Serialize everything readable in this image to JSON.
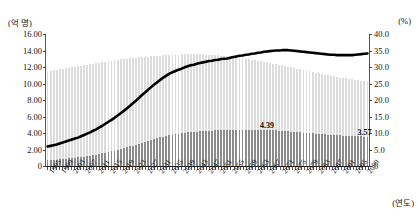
{
  "chart_data": {
    "type": "bar",
    "title": "",
    "subtitle": "",
    "xlabel": "(연도)",
    "ylabel": "(억 명)",
    "y2label": "(%)",
    "grid": false,
    "legend_position": "none",
    "ylim": [
      0,
      16
    ],
    "y2lim": [
      0,
      40
    ],
    "ytick_labels": [
      "16.00",
      "14.00",
      "12.00",
      "10.00",
      "8.00",
      "6.00",
      "4.00",
      "2.00",
      "0"
    ],
    "ytick_values": [
      16,
      14,
      12,
      10,
      8,
      6,
      4,
      2,
      0
    ],
    "y2tick_labels": [
      "40.0",
      "35.0",
      "30.0",
      "25.0",
      "20.0",
      "15.0",
      "10.0",
      "5.0",
      "0"
    ],
    "y2tick_values": [
      40,
      35,
      30,
      25,
      20,
      15,
      10,
      5,
      0
    ],
    "xlim": [
      1995,
      2100
    ],
    "xtick_labels": [
      "1995",
      "1999",
      "2003",
      "2007",
      "2011",
      "2015",
      "2019",
      "2023",
      "2027",
      "2031",
      "2035",
      "2039",
      "2043",
      "2047",
      "2051",
      "2055",
      "2059",
      "2063",
      "2067",
      "2071",
      "2075",
      "2079",
      "2083",
      "2087",
      "2091",
      "2095",
      "2099"
    ],
    "xtick_values": [
      1995,
      1999,
      2003,
      2007,
      2011,
      2015,
      2019,
      2023,
      2027,
      2031,
      2035,
      2039,
      2043,
      2047,
      2051,
      2055,
      2059,
      2063,
      2067,
      2071,
      2075,
      2079,
      2083,
      2087,
      2091,
      2095,
      2099
    ],
    "x": [
      1995,
      1996,
      1997,
      1998,
      1999,
      2000,
      2001,
      2002,
      2003,
      2004,
      2005,
      2006,
      2007,
      2008,
      2009,
      2010,
      2011,
      2012,
      2013,
      2014,
      2015,
      2016,
      2017,
      2018,
      2019,
      2020,
      2021,
      2022,
      2023,
      2024,
      2025,
      2026,
      2027,
      2028,
      2029,
      2030,
      2031,
      2032,
      2033,
      2034,
      2035,
      2036,
      2037,
      2038,
      2039,
      2040,
      2041,
      2042,
      2043,
      2044,
      2045,
      2046,
      2047,
      2048,
      2049,
      2050,
      2051,
      2052,
      2053,
      2054,
      2055,
      2056,
      2057,
      2058,
      2059,
      2060,
      2061,
      2062,
      2063,
      2064,
      2065,
      2066,
      2067,
      2068,
      2069,
      2070,
      2071,
      2072,
      2073,
      2074,
      2075,
      2076,
      2077,
      2078,
      2079,
      2080,
      2081,
      2082,
      2083,
      2084,
      2085,
      2086,
      2087,
      2088,
      2089,
      2090,
      2091,
      2092,
      2093,
      2094,
      2095,
      2096,
      2097,
      2098,
      2099,
      2100
    ],
    "series": [
      {
        "name": "총인구",
        "type": "bar",
        "color": "#dcdcdc",
        "axis": "left",
        "values": [
          11.45,
          11.53,
          11.61,
          11.68,
          11.75,
          11.82,
          11.88,
          11.94,
          12.0,
          12.06,
          12.12,
          12.18,
          12.24,
          12.3,
          12.36,
          12.42,
          12.48,
          12.54,
          12.6,
          12.66,
          12.72,
          12.78,
          12.83,
          12.88,
          12.93,
          12.97,
          13.01,
          13.05,
          13.09,
          13.13,
          13.17,
          13.2,
          13.23,
          13.26,
          13.29,
          13.32,
          13.35,
          13.38,
          13.41,
          13.43,
          13.45,
          13.47,
          13.49,
          13.51,
          13.52,
          13.53,
          13.54,
          13.54,
          13.54,
          13.54,
          13.53,
          13.52,
          13.51,
          13.49,
          13.47,
          13.45,
          13.42,
          13.39,
          13.36,
          13.32,
          13.28,
          13.24,
          13.19,
          13.14,
          13.09,
          13.03,
          12.97,
          12.91,
          12.85,
          12.78,
          12.71,
          12.64,
          12.57,
          12.5,
          12.42,
          12.35,
          12.27,
          12.19,
          12.11,
          12.03,
          11.95,
          11.87,
          11.79,
          11.71,
          11.63,
          11.55,
          11.47,
          11.39,
          11.31,
          11.23,
          11.16,
          11.08,
          11.01,
          10.94,
          10.87,
          10.8,
          10.73,
          10.67,
          10.61,
          10.55,
          10.49,
          10.44,
          10.39,
          10.34,
          10.29,
          10.25
        ]
      },
      {
        "name": "고령인구",
        "type": "bar",
        "color": "#8c8c8c",
        "axis": "left",
        "values": [
          0.68,
          0.71,
          0.74,
          0.77,
          0.8,
          0.84,
          0.88,
          0.92,
          0.96,
          1.0,
          1.05,
          1.1,
          1.15,
          1.2,
          1.26,
          1.32,
          1.39,
          1.46,
          1.53,
          1.61,
          1.69,
          1.78,
          1.87,
          1.96,
          2.06,
          2.16,
          2.26,
          2.37,
          2.48,
          2.59,
          2.71,
          2.83,
          2.95,
          3.06,
          3.17,
          3.28,
          3.38,
          3.48,
          3.57,
          3.66,
          3.74,
          3.81,
          3.88,
          3.94,
          3.99,
          4.04,
          4.08,
          4.12,
          4.15,
          4.18,
          4.21,
          4.24,
          4.26,
          4.28,
          4.3,
          4.31,
          4.32,
          4.33,
          4.34,
          4.35,
          4.36,
          4.37,
          4.37,
          4.38,
          4.38,
          4.39,
          4.39,
          4.39,
          4.39,
          4.39,
          4.38,
          4.37,
          4.36,
          4.35,
          4.33,
          4.31,
          4.29,
          4.27,
          4.24,
          4.21,
          4.18,
          4.15,
          4.12,
          4.09,
          4.06,
          4.03,
          4.0,
          3.97,
          3.94,
          3.91,
          3.88,
          3.85,
          3.82,
          3.79,
          3.76,
          3.73,
          3.71,
          3.69,
          3.67,
          3.65,
          3.63,
          3.61,
          3.6,
          3.59,
          3.57,
          3.56
        ]
      },
      {
        "name": "고령인구 비중",
        "type": "line",
        "color": "#000000",
        "axis": "right",
        "values": [
          5.9,
          6.1,
          6.3,
          6.5,
          6.8,
          7.1,
          7.4,
          7.7,
          8.0,
          8.3,
          8.6,
          9.0,
          9.4,
          9.8,
          10.2,
          10.7,
          11.1,
          11.7,
          12.2,
          12.8,
          13.4,
          14.0,
          14.6,
          15.3,
          16.0,
          16.7,
          17.4,
          18.2,
          19.0,
          19.8,
          20.6,
          21.5,
          22.3,
          23.1,
          23.9,
          24.7,
          25.4,
          26.1,
          26.8,
          27.4,
          28.0,
          28.4,
          28.8,
          29.2,
          29.5,
          29.9,
          30.2,
          30.5,
          30.7,
          31.0,
          31.2,
          31.4,
          31.6,
          31.8,
          31.9,
          32.1,
          32.2,
          32.4,
          32.5,
          32.6,
          32.8,
          33.0,
          33.2,
          33.4,
          33.5,
          33.7,
          33.8,
          34.0,
          34.1,
          34.3,
          34.4,
          34.6,
          34.7,
          34.8,
          34.9,
          35.0,
          35.0,
          35.1,
          35.1,
          35.1,
          35.0,
          34.9,
          34.8,
          34.7,
          34.6,
          34.5,
          34.4,
          34.3,
          34.2,
          34.1,
          34.0,
          33.9,
          33.8,
          33.7,
          33.7,
          33.6,
          33.6,
          33.6,
          33.6,
          33.6,
          33.6,
          33.7,
          33.8,
          33.9,
          34.0,
          34.1
        ]
      }
    ],
    "annotations": [
      {
        "label": "4.39",
        "x": 2067,
        "y": 4.39,
        "series": "고령인구"
      },
      {
        "label": "3.57",
        "x": 2099,
        "y": 3.57,
        "series": "고령인구"
      }
    ]
  }
}
